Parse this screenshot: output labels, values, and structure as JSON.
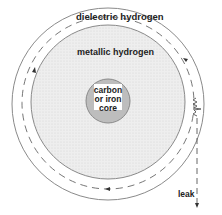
{
  "diagram": {
    "type": "planet-interior-cross-section",
    "labels": {
      "outer_layer": "dielectric hydrogen",
      "middle_layer": "metallic hydrogen",
      "core_line1": "carbon",
      "core_line2": "or iron",
      "core_line3": "core",
      "leak": "leak"
    },
    "colors": {
      "background": "#ffffff",
      "outline": "#8a8a8a",
      "metallic_fill": "#ebebeb",
      "core_fill": "#bdbdbd",
      "core_label_bg": "#ffffff",
      "text": "#222222"
    }
  }
}
